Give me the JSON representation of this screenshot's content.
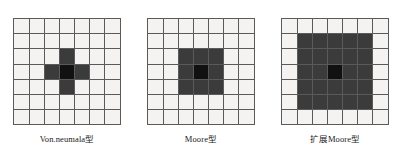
{
  "figure": {
    "background_color": "#ffffff",
    "cell_color": "#f4f3f1",
    "filled_color": "#3b3b3b",
    "center_color": "#111111",
    "gridline_color": "#5a5a5a",
    "grid_rows": 7,
    "grid_cols": 7
  },
  "panels": [
    {
      "id": "von-neumann",
      "caption": "Von.neumala型",
      "neighborhood": "von-neumann",
      "grid": [
        [
          0,
          0,
          0,
          0,
          0,
          0,
          0
        ],
        [
          0,
          0,
          0,
          0,
          0,
          0,
          0
        ],
        [
          0,
          0,
          0,
          1,
          0,
          0,
          0
        ],
        [
          0,
          0,
          1,
          2,
          1,
          0,
          0
        ],
        [
          0,
          0,
          0,
          1,
          0,
          0,
          0
        ],
        [
          0,
          0,
          0,
          0,
          0,
          0,
          0
        ],
        [
          0,
          0,
          0,
          0,
          0,
          0,
          0
        ]
      ]
    },
    {
      "id": "moore",
      "caption": "Moore型",
      "neighborhood": "moore",
      "grid": [
        [
          0,
          0,
          0,
          0,
          0,
          0,
          0
        ],
        [
          0,
          0,
          0,
          0,
          0,
          0,
          0
        ],
        [
          0,
          0,
          1,
          1,
          1,
          0,
          0
        ],
        [
          0,
          0,
          1,
          2,
          1,
          0,
          0
        ],
        [
          0,
          0,
          1,
          1,
          1,
          0,
          0
        ],
        [
          0,
          0,
          0,
          0,
          0,
          0,
          0
        ],
        [
          0,
          0,
          0,
          0,
          0,
          0,
          0
        ]
      ]
    },
    {
      "id": "extended-moore",
      "caption": "扩展Moore型",
      "neighborhood": "extended-moore",
      "grid": [
        [
          0,
          0,
          0,
          0,
          0,
          0,
          0
        ],
        [
          0,
          1,
          1,
          1,
          1,
          1,
          0
        ],
        [
          0,
          1,
          1,
          1,
          1,
          1,
          0
        ],
        [
          0,
          1,
          1,
          2,
          1,
          1,
          0
        ],
        [
          0,
          1,
          1,
          1,
          1,
          1,
          0
        ],
        [
          0,
          1,
          1,
          1,
          1,
          1,
          0
        ],
        [
          0,
          0,
          0,
          0,
          0,
          0,
          0
        ]
      ]
    }
  ]
}
